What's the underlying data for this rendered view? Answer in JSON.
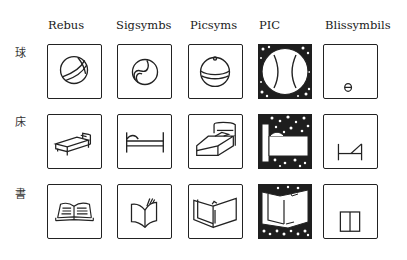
{
  "columns": [
    {
      "label": "Rebus"
    },
    {
      "label": "Sigsymbs"
    },
    {
      "label": "Picsyms"
    },
    {
      "label": "PIC"
    },
    {
      "label": "Blissymbils"
    }
  ],
  "rows": [
    {
      "label": "球",
      "concept": "ball",
      "icons": [
        "rebus-ball-icon",
        "sigsymbs-ball-icon",
        "picsyms-ball-icon",
        "pic-ball-icon",
        "bliss-ball-icon"
      ]
    },
    {
      "label": "床",
      "concept": "bed",
      "icons": [
        "rebus-bed-icon",
        "sigsymbs-bed-icon",
        "picsyms-bed-icon",
        "pic-bed-icon",
        "bliss-bed-icon"
      ]
    },
    {
      "label": "書",
      "concept": "book",
      "icons": [
        "rebus-book-icon",
        "sigsymbs-book-icon",
        "picsyms-book-icon",
        "pic-book-icon",
        "bliss-book-icon"
      ]
    }
  ],
  "colors": {
    "ink": "#222222",
    "background": "#ffffff"
  }
}
